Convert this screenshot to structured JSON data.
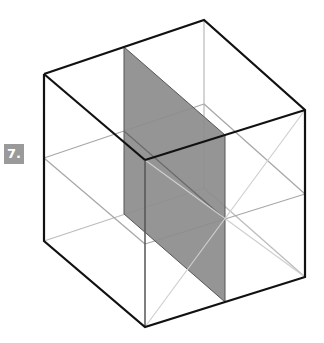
{
  "figure": {
    "label": "7.",
    "label_color": "#9a9a9a",
    "plane_color": "#8c8c8c",
    "edge_color": "#111111",
    "guide_color": "#bdbdbd"
  }
}
